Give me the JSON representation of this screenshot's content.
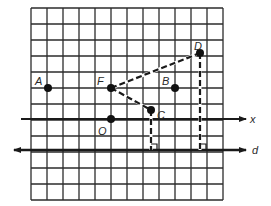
{
  "grid": {
    "left": 31,
    "top": 8,
    "cell": 16,
    "cols": 12,
    "rows": 12,
    "line_color": "#2b2b2b"
  },
  "points": [
    {
      "label": "A",
      "x": 48,
      "y": 88,
      "lx": 35,
      "ly": 81
    },
    {
      "label": "F",
      "x": 111,
      "y": 88,
      "lx": 97,
      "ly": 81
    },
    {
      "label": "B",
      "x": 175,
      "y": 88,
      "lx": 162,
      "ly": 81
    },
    {
      "label": "D",
      "x": 200,
      "y": 53,
      "lx": 194,
      "ly": 46
    },
    {
      "label": "O",
      "x": 111,
      "y": 119,
      "lx": 98,
      "ly": 131
    },
    {
      "label": "C",
      "x": 151,
      "y": 110,
      "lx": 157,
      "ly": 115
    }
  ],
  "lines": {
    "x_axis": {
      "label": "x",
      "y": 119,
      "x1": 21,
      "x2": 246,
      "lx": 250,
      "ly": 123
    },
    "d_line": {
      "label": "d",
      "y": 150,
      "x1": 14,
      "x2": 246,
      "lx": 252,
      "ly": 154
    }
  },
  "segments": [
    {
      "name": "segment-FD",
      "from": "F",
      "to": "D",
      "style": "dashed"
    },
    {
      "name": "segment-FC",
      "from": "F",
      "to": "C",
      "style": "dashed"
    },
    {
      "name": "perp-C-to-d",
      "from": "C",
      "to_y": 150,
      "style": "dashed"
    },
    {
      "name": "perp-D-to-d",
      "from": "D",
      "to_y": 150,
      "style": "dashed"
    }
  ]
}
